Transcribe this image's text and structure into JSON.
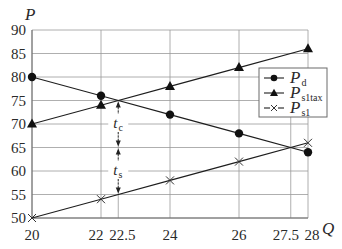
{
  "chart_data": {
    "type": "line",
    "title": "",
    "xlabel": "Q",
    "ylabel": "P",
    "xlim": [
      20,
      28
    ],
    "ylim": [
      50,
      90
    ],
    "grid": true,
    "x_ticks": [
      20,
      22,
      22.5,
      24,
      26,
      27.5,
      28
    ],
    "x_tick_labels": [
      "20",
      "22",
      "22.5",
      "24",
      "26",
      "27.5",
      "28"
    ],
    "y_ticks": [
      50,
      55,
      60,
      65,
      70,
      75,
      80,
      85,
      90
    ],
    "y_tick_labels": [
      "50",
      "55",
      "60",
      "65",
      "70",
      "75",
      "80",
      "85",
      "90"
    ],
    "legend_position": "upper right",
    "series": [
      {
        "name": "P_d",
        "label_main": "P",
        "label_sub": "d",
        "marker": "circle",
        "x": [
          20,
          22,
          24,
          26,
          28
        ],
        "values": [
          80,
          76,
          72,
          68,
          64
        ]
      },
      {
        "name": "P_s1tax",
        "label_main": "P",
        "label_sub": "s1tax",
        "marker": "triangle",
        "x": [
          20,
          22,
          24,
          26,
          28
        ],
        "values": [
          70,
          74,
          78,
          82,
          86
        ]
      },
      {
        "name": "P_s1",
        "label_main": "P",
        "label_sub": "s1",
        "marker": "x",
        "x": [
          20,
          22,
          24,
          26,
          28
        ],
        "values": [
          50,
          54,
          58,
          62,
          66
        ]
      }
    ],
    "annotations": [
      {
        "label_main": "t",
        "label_sub": "c",
        "x": 22.5,
        "from": 75,
        "to": 65,
        "label_y": 70,
        "description": "consumer tax burden"
      },
      {
        "label_main": "t",
        "label_sub": "s",
        "x": 22.5,
        "from": 65,
        "to": 55,
        "label_y": 60,
        "description": "supplier tax burden"
      }
    ]
  },
  "colors": {
    "line": "#1e1e1e",
    "grid": "#9a9a9a",
    "text": "#2a2a2a",
    "background": "#ffffff"
  }
}
